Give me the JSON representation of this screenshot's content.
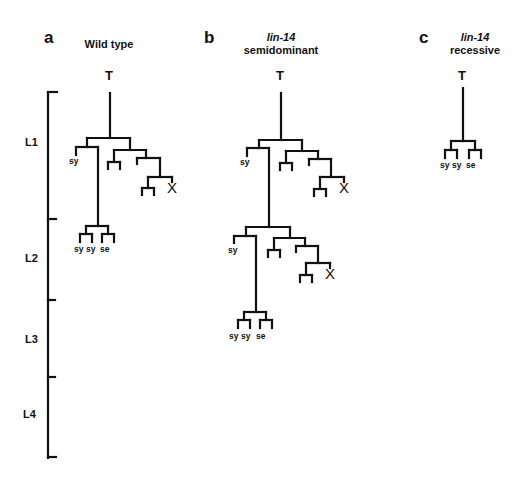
{
  "panels": [
    {
      "letter": "a",
      "title_line1": "",
      "title_line2": "Wild type",
      "root": "T",
      "leaves": [
        "sy",
        "sy",
        "sy",
        "se"
      ],
      "death": "X"
    },
    {
      "letter": "b",
      "title_line1": "lin-14",
      "title_line2": "semidominant",
      "root": "T",
      "leaves": [
        "sy",
        "sy",
        "sy",
        "sy",
        "se"
      ],
      "death": "X"
    },
    {
      "letter": "c",
      "title_line1": "lin-14",
      "title_line2": "recessive",
      "root": "T",
      "leaves": [
        "sy",
        "sy",
        "se"
      ]
    }
  ],
  "timeline": {
    "stages": [
      "L1",
      "L2",
      "L3",
      "L4"
    ]
  },
  "labels": {
    "sy": "sy",
    "se": "se",
    "death": "X"
  },
  "colors": {
    "line": "#111111",
    "background": "#ffffff"
  }
}
